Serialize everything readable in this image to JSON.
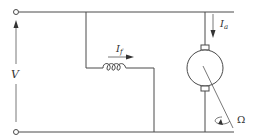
{
  "diagram": {
    "labels": {
      "voltage": "V",
      "field_current": "I",
      "field_current_sub": "f",
      "armature_current": "I",
      "armature_current_sub": "a",
      "angular_speed": "Ω"
    },
    "components": [
      {
        "id": "supply-terminals",
        "type": "terminal-pair",
        "label": "V"
      },
      {
        "id": "field-winding",
        "type": "inductor",
        "label": "I_f"
      },
      {
        "id": "armature",
        "type": "dc-machine",
        "label": "I_a"
      },
      {
        "id": "shaft-rotation",
        "type": "rotation-arrow",
        "label": "Ω"
      }
    ],
    "colors": {
      "stroke": "#4a4a4a",
      "text": "#333333",
      "background": "#ffffff"
    }
  }
}
